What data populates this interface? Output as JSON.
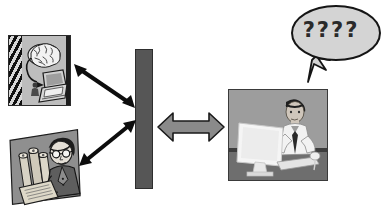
{
  "scene": {
    "title": "Knowledge transfer diagram",
    "background_color": "#ffffff",
    "width": 388,
    "height": 215
  },
  "speech_bubble": {
    "text": "????",
    "fill_color": "#d4d4d4",
    "stroke_color": "#1a1a1a",
    "tail_direction": "down-left",
    "points_to": "man-at-computer"
  },
  "panels": {
    "brain_computer": {
      "name": "brain-computer-photo",
      "caption": "",
      "elements": [
        "brain",
        "arrow",
        "laptop"
      ],
      "border_color": "#2b2b2b",
      "background_color": "#b9b9b9",
      "stripe_color": "#111111"
    },
    "scholar": {
      "name": "scholar-photo",
      "caption": "",
      "elements": [
        "scrolls",
        "scholar-with-glasses",
        "open-document"
      ],
      "background_color": "#8f8f8f"
    },
    "man_at_computer": {
      "name": "man-at-computer-photo",
      "caption": "",
      "elements": [
        "monitor",
        "man-in-shirt-and-tie",
        "keyboard",
        "mouse"
      ],
      "border_color": "#3a3a3a",
      "background_color": "#9a9a9a"
    }
  },
  "barrier": {
    "name": "vertical-barrier",
    "label": "",
    "fill_color": "#565656",
    "stroke_color": "#2e2e2e"
  },
  "arrows": {
    "brain_to_barrier": {
      "name": "arrow-brain-to-barrier",
      "style": "double-headed",
      "color": "#0d0d0d",
      "direction": "diagonal-down-right"
    },
    "scholar_to_barrier": {
      "name": "arrow-scholar-to-barrier",
      "style": "double-headed",
      "color": "#0d0d0d",
      "direction": "diagonal-up-right"
    },
    "barrier_to_user": {
      "name": "arrow-barrier-to-user",
      "style": "double-headed-block",
      "fill_color": "#8a8a8a",
      "stroke_color": "#1a1a1a",
      "direction": "horizontal"
    }
  }
}
